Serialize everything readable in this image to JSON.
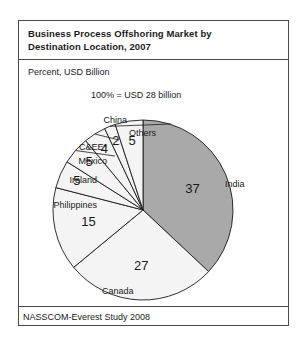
{
  "figure": {
    "title_line1": "Business Process Offshoring Market by",
    "title_line2": "Destination Location, 2007",
    "axis_note": "Percent, USD Billion",
    "total_note": "100% = USD 28 billion",
    "source": "NASSCOM-Everest Study 2008"
  },
  "chart_data": {
    "type": "pie",
    "title": "Business Process Offshoring Market by Destination Location, 2007",
    "subtitle": "Percent, USD Billion",
    "annotations": [
      "100% = USD 28 billion"
    ],
    "unit": "percent",
    "total_label": "100% = USD 28 billion",
    "total_value": 100,
    "total_usd_billion": 28,
    "start_angle_deg": 0,
    "direction": "clockwise",
    "legend": "none",
    "grid": false,
    "footnote_marker": "*",
    "categories": [
      "India",
      "Canada",
      "Philippines",
      "Ireland",
      "Mexico",
      "C&EE*",
      "China",
      "Others"
    ],
    "values": [
      37,
      27,
      15,
      5,
      5,
      4,
      2,
      5
    ],
    "colors": [
      "#a9a9a9",
      "#f4f4f4",
      "#f4f4f4",
      "#f4f4f4",
      "#f4f4f4",
      "#f4f4f4",
      "#f4f4f4",
      "#f4f4f4"
    ],
    "slices": [
      {
        "name": "India",
        "value": 37,
        "value_label": "37",
        "color": "#a9a9a9"
      },
      {
        "name": "Canada",
        "value": 27,
        "value_label": "27",
        "color": "#f4f4f4"
      },
      {
        "name": "Philippines",
        "value": 15,
        "value_label": "15",
        "color": "#f4f4f4"
      },
      {
        "name": "Ireland",
        "value": 5,
        "value_label": "5",
        "color": "#f4f4f4"
      },
      {
        "name": "Mexico",
        "value": 5,
        "value_label": "5",
        "color": "#f4f4f4"
      },
      {
        "name": "C&EE*",
        "value": 4,
        "value_label": "4",
        "color": "#f4f4f4"
      },
      {
        "name": "China",
        "value": 2,
        "value_label": "2",
        "color": "#f4f4f4"
      },
      {
        "name": "Others",
        "value": 5,
        "value_label": "5",
        "color": "#f4f4f4"
      }
    ]
  }
}
